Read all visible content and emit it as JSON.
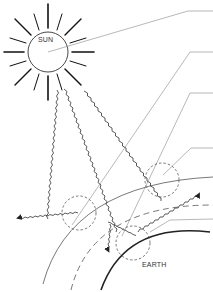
{
  "diagram": {
    "type": "solar-radiation-schematic",
    "labels": {
      "sun": "SUN",
      "earth": "EARTH"
    },
    "callouts": [
      {
        "id": "callout-1",
        "text": ""
      },
      {
        "id": "callout-2",
        "text": ""
      },
      {
        "id": "callout-3",
        "text": ""
      },
      {
        "id": "callout-4",
        "text": ""
      }
    ],
    "colors": {
      "line": "#333333",
      "leader": "#999999",
      "background": "#ffffff"
    }
  }
}
